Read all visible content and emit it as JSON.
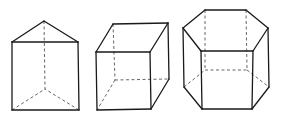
{
  "figure": {
    "title": "",
    "colors": {
      "visible_edge": "#1a1a1a",
      "hidden_edge": "#555555",
      "background": "#ffffff"
    },
    "shapes": [
      {
        "name": "triangular-prism",
        "visible": [
          [
            [
              12,
              42
            ],
            [
              44,
              21
            ]
          ],
          [
            [
              44,
              21
            ],
            [
              78,
              42
            ]
          ],
          [
            [
              12,
              42
            ],
            [
              78,
              42
            ]
          ],
          [
            [
              12,
              42
            ],
            [
              12,
              110
            ]
          ],
          [
            [
              78,
              42
            ],
            [
              79,
              110
            ]
          ],
          [
            [
              12,
              110
            ],
            [
              79,
              110
            ]
          ]
        ],
        "hidden": [
          [
            [
              44,
              21
            ],
            [
              45,
              89
            ]
          ],
          [
            [
              12,
              110
            ],
            [
              45,
              89
            ]
          ],
          [
            [
              79,
              110
            ],
            [
              45,
              89
            ]
          ]
        ]
      },
      {
        "name": "cube",
        "visible": [
          [
            [
              96,
              52
            ],
            [
              150,
              52
            ]
          ],
          [
            [
              150,
              52
            ],
            [
              151,
              109
            ]
          ],
          [
            [
              151,
              109
            ],
            [
              97,
              110
            ]
          ],
          [
            [
              97,
              110
            ],
            [
              96,
              52
            ]
          ],
          [
            [
              96,
              52
            ],
            [
              113,
              24
            ]
          ],
          [
            [
              113,
              24
            ],
            [
              168,
              23
            ]
          ],
          [
            [
              168,
              23
            ],
            [
              150,
              52
            ]
          ],
          [
            [
              168,
              23
            ],
            [
              169,
              79
            ]
          ],
          [
            [
              169,
              79
            ],
            [
              151,
              109
            ]
          ]
        ],
        "hidden": [
          [
            [
              113,
              24
            ],
            [
              115,
              80
            ]
          ],
          [
            [
              115,
              80
            ],
            [
              169,
              79
            ]
          ],
          [
            [
              115,
              80
            ],
            [
              97,
              110
            ]
          ]
        ]
      },
      {
        "name": "hexagonal-prism",
        "visible": [
          [
            [
              205,
              10
            ],
            [
              246,
              10
            ]
          ],
          [
            [
              246,
              10
            ],
            [
              268,
              28
            ]
          ],
          [
            [
              268,
              28
            ],
            [
              253,
              51
            ]
          ],
          [
            [
              253,
              51
            ],
            [
              201,
              51
            ]
          ],
          [
            [
              201,
              51
            ],
            [
              183,
              28
            ]
          ],
          [
            [
              183,
              28
            ],
            [
              205,
              10
            ]
          ],
          [
            [
              183,
              28
            ],
            [
              184,
              87
            ]
          ],
          [
            [
              201,
              51
            ],
            [
              202,
              109
            ]
          ],
          [
            [
              253,
              51
            ],
            [
              252,
              109
            ]
          ],
          [
            [
              268,
              28
            ],
            [
              269,
              87
            ]
          ],
          [
            [
              184,
              87
            ],
            [
              202,
              109
            ]
          ],
          [
            [
              202,
              109
            ],
            [
              252,
              109
            ]
          ],
          [
            [
              252,
              109
            ],
            [
              269,
              87
            ]
          ]
        ],
        "hidden": [
          [
            [
              205,
              10
            ],
            [
              205,
              70
            ]
          ],
          [
            [
              246,
              10
            ],
            [
              247,
              70
            ]
          ],
          [
            [
              184,
              87
            ],
            [
              205,
              70
            ]
          ],
          [
            [
              205,
              70
            ],
            [
              247,
              70
            ]
          ],
          [
            [
              247,
              70
            ],
            [
              269,
              87
            ]
          ]
        ]
      }
    ]
  }
}
